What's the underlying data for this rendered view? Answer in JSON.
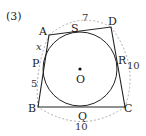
{
  "problem_label": "(3)",
  "points": {
    "A": {
      "label": "A",
      "x": 49,
      "y": 35
    },
    "D": {
      "label": "D",
      "x": 111,
      "y": 27
    },
    "B": {
      "label": "B",
      "x": 38,
      "y": 107
    },
    "C": {
      "label": "C",
      "x": 125,
      "y": 107
    },
    "O": {
      "label": "O",
      "x": 80,
      "y": 69
    }
  },
  "tangent_points": {
    "S": "S",
    "P": "P",
    "R": "R",
    "Q": "Q"
  },
  "incircle": {
    "cx": 80,
    "cy": 69,
    "r": 37
  },
  "lengths": {
    "AD": "7",
    "DC": "10",
    "BC": "10",
    "PB": "5",
    "AP": "x"
  },
  "colors": {
    "stroke": "#222222",
    "dashed": "#888888"
  }
}
